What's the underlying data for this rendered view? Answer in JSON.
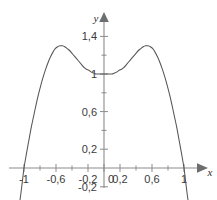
{
  "figure": {
    "header_fragment": "",
    "background_color": "#ffffff",
    "axis_color": "#8b8b8b",
    "curve_color": "#555555",
    "label_color": "#3a3a3a"
  },
  "chart_data": {
    "type": "line",
    "title": "",
    "xlabel": "x",
    "ylabel": "y",
    "xlim": [
      -1.12,
      1.16
    ],
    "ylim": [
      -0.32,
      1.58
    ],
    "grid": false,
    "legend": null,
    "decimal_separator": ",",
    "x_ticks": [
      -1,
      -0.8,
      -0.6,
      -0.4,
      -0.2,
      0,
      0.2,
      0.4,
      0.6,
      0.8,
      1
    ],
    "x_tick_labels": [
      "-1",
      "",
      "-0,6",
      "",
      "-0,2",
      "0",
      "0,2",
      "",
      "0,6",
      "",
      "1"
    ],
    "y_ticks": [
      -0.2,
      0,
      0.2,
      0.4,
      0.6,
      0.8,
      1,
      1.2,
      1.4
    ],
    "y_tick_labels": [
      "-0,2",
      "",
      "0,2",
      "",
      "0,6",
      "",
      "1",
      "",
      "1,4"
    ],
    "series": [
      {
        "name": "curve",
        "x": [
          -1.08,
          -1.05,
          -1.02,
          -1.0,
          -0.97,
          -0.94,
          -0.91,
          -0.88,
          -0.85,
          -0.82,
          -0.79,
          -0.76,
          -0.73,
          -0.7,
          -0.67,
          -0.64,
          -0.61,
          -0.58,
          -0.55,
          -0.52,
          -0.49,
          -0.46,
          -0.43,
          -0.4,
          -0.37,
          -0.34,
          -0.31,
          -0.28,
          -0.25,
          -0.22,
          -0.19,
          -0.16,
          -0.13,
          -0.1,
          -0.07,
          -0.04,
          -0.01,
          0.0,
          0.01,
          0.04,
          0.07,
          0.1,
          0.13,
          0.16,
          0.19,
          0.22,
          0.25,
          0.28,
          0.31,
          0.34,
          0.37,
          0.4,
          0.43,
          0.46,
          0.49,
          0.52,
          0.55,
          0.58,
          0.61,
          0.64,
          0.67,
          0.7,
          0.73,
          0.76,
          0.79,
          0.82,
          0.85,
          0.88,
          0.91,
          0.94,
          0.97,
          1.0,
          1.02,
          1.05,
          1.08
        ],
        "y": [
          -0.47,
          -0.34,
          -0.14,
          0.0,
          0.15,
          0.29,
          0.43,
          0.55,
          0.67,
          0.78,
          0.88,
          0.97,
          1.05,
          1.12,
          1.18,
          1.23,
          1.27,
          1.29,
          1.3,
          1.3,
          1.29,
          1.27,
          1.25,
          1.22,
          1.19,
          1.16,
          1.13,
          1.1,
          1.07,
          1.05,
          1.04,
          1.02,
          1.01,
          1.0,
          1.0,
          1.0,
          1.0,
          1.0,
          1.0,
          1.0,
          1.0,
          1.0,
          1.01,
          1.02,
          1.04,
          1.05,
          1.07,
          1.1,
          1.13,
          1.16,
          1.19,
          1.22,
          1.25,
          1.27,
          1.29,
          1.3,
          1.3,
          1.29,
          1.27,
          1.23,
          1.18,
          1.12,
          1.05,
          0.97,
          0.88,
          0.78,
          0.67,
          0.55,
          0.43,
          0.29,
          0.15,
          0.0,
          -0.14,
          -0.34,
          -0.47
        ]
      }
    ],
    "annotations": {
      "zeros": [
        -1,
        1
      ],
      "local_minimum": {
        "x": 0,
        "y": 1
      },
      "local_maxima": [
        {
          "x": -0.56,
          "y": 1.3
        },
        {
          "x": 0.56,
          "y": 1.3
        }
      ]
    }
  }
}
